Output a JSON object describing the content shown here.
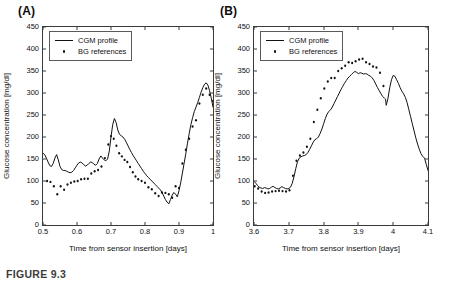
{
  "figure": {
    "caption": "FIGURE 9.3"
  },
  "panels": [
    {
      "label": "(A)",
      "legend": {
        "line_label": "CGM profile",
        "dot_label": "BG references"
      },
      "xlabel": "Time from sensor insertion [days]",
      "ylabel": "Glucose concentration [mg/dl]",
      "xticks": [
        "0.5",
        "0.6",
        "0.7",
        "0.8",
        "0.9",
        "1"
      ],
      "yticks": [
        "0",
        "50",
        "100",
        "150",
        "200",
        "250",
        "300",
        "350",
        "400",
        "450"
      ]
    },
    {
      "label": "(B)",
      "legend": {
        "line_label": "CGM profile",
        "dot_label": "BG references"
      },
      "xlabel": "Time from sensor insertion [days]",
      "ylabel": "Glucose concentration [mg/dl]",
      "xticks": [
        "3.6",
        "3.7",
        "3.8",
        "3.9",
        "4",
        "4.1"
      ],
      "yticks": [
        "0",
        "50",
        "100",
        "150",
        "200",
        "250",
        "300",
        "350",
        "400",
        "450"
      ]
    }
  ],
  "chart_data": [
    {
      "type": "line",
      "panel": "(A)",
      "title": "",
      "xlabel": "Time from sensor insertion [days]",
      "ylabel": "Glucose concentration [mg/dl]",
      "xlim": [
        0.5,
        1.0
      ],
      "ylim": [
        0,
        450
      ],
      "xticks": [
        0.5,
        0.6,
        0.7,
        0.8,
        0.9,
        1.0
      ],
      "yticks": [
        0,
        50,
        100,
        150,
        200,
        250,
        300,
        350,
        400,
        450
      ],
      "grid": false,
      "legend_position": "upper-left",
      "series": [
        {
          "name": "CGM profile",
          "style": "line",
          "color": "#111111",
          "x": [
            0.5,
            0.505,
            0.51,
            0.515,
            0.52,
            0.525,
            0.53,
            0.535,
            0.54,
            0.545,
            0.55,
            0.555,
            0.56,
            0.565,
            0.57,
            0.575,
            0.58,
            0.585,
            0.59,
            0.595,
            0.6,
            0.605,
            0.61,
            0.615,
            0.62,
            0.625,
            0.63,
            0.635,
            0.64,
            0.645,
            0.65,
            0.655,
            0.66,
            0.665,
            0.67,
            0.675,
            0.68,
            0.685,
            0.69,
            0.695,
            0.7,
            0.705,
            0.71,
            0.715,
            0.72,
            0.725,
            0.73,
            0.735,
            0.74,
            0.745,
            0.75,
            0.755,
            0.76,
            0.765,
            0.77,
            0.775,
            0.78,
            0.785,
            0.79,
            0.795,
            0.8,
            0.805,
            0.81,
            0.815,
            0.82,
            0.825,
            0.83,
            0.835,
            0.84,
            0.845,
            0.85,
            0.855,
            0.86,
            0.865,
            0.87,
            0.875,
            0.88,
            0.885,
            0.89,
            0.895,
            0.9,
            0.905,
            0.91,
            0.915,
            0.92,
            0.925,
            0.93,
            0.935,
            0.94,
            0.945,
            0.95,
            0.955,
            0.96,
            0.965,
            0.97,
            0.975,
            0.98,
            0.985,
            0.99,
            0.995,
            1.0
          ],
          "y": [
            163,
            160,
            152,
            143,
            135,
            133,
            140,
            152,
            160,
            148,
            133,
            126,
            124,
            124,
            122,
            120,
            119,
            120,
            124,
            130,
            136,
            141,
            143,
            141,
            137,
            134,
            136,
            140,
            143,
            142,
            138,
            136,
            140,
            150,
            157,
            152,
            148,
            146,
            150,
            168,
            200,
            228,
            242,
            233,
            216,
            206,
            203,
            200,
            195,
            188,
            180,
            172,
            165,
            158,
            152,
            146,
            140,
            134,
            128,
            122,
            117,
            112,
            108,
            104,
            100,
            96,
            92,
            88,
            84,
            80,
            74,
            66,
            58,
            52,
            48,
            58,
            68,
            74,
            70,
            64,
            78,
            96,
            118,
            140,
            162,
            186,
            208,
            228,
            244,
            258,
            268,
            278,
            290,
            302,
            312,
            320,
            323,
            318,
            305,
            288,
            268
          ]
        },
        {
          "name": "BG references",
          "style": "scatter",
          "color": "#111111",
          "x": [
            0.512,
            0.522,
            0.532,
            0.542,
            0.552,
            0.562,
            0.572,
            0.582,
            0.592,
            0.602,
            0.612,
            0.622,
            0.632,
            0.642,
            0.652,
            0.662,
            0.672,
            0.682,
            0.692,
            0.7,
            0.708,
            0.716,
            0.724,
            0.732,
            0.74,
            0.748,
            0.756,
            0.764,
            0.772,
            0.78,
            0.79,
            0.8,
            0.81,
            0.82,
            0.83,
            0.84,
            0.85,
            0.86,
            0.87,
            0.88,
            0.89,
            0.9,
            0.91,
            0.92,
            0.93,
            0.94,
            0.95,
            0.96,
            0.97,
            0.98,
            0.99,
            1.0
          ],
          "y": [
            100,
            98,
            88,
            70,
            88,
            80,
            92,
            96,
            99,
            100,
            104,
            105,
            105,
            117,
            122,
            125,
            133,
            152,
            183,
            202,
            196,
            180,
            163,
            156,
            148,
            143,
            132,
            120,
            110,
            104,
            100,
            96,
            86,
            81,
            72,
            66,
            74,
            73,
            70,
            62,
            88,
            84,
            140,
            171,
            196,
            224,
            238,
            276,
            296,
            310,
            296,
            282
          ]
        }
      ]
    },
    {
      "type": "line",
      "panel": "(B)",
      "title": "",
      "xlabel": "Time from sensor insertion [days]",
      "ylabel": "Glucose concentration [mg/dl]",
      "xlim": [
        3.6,
        4.1
      ],
      "ylim": [
        0,
        450
      ],
      "xticks": [
        3.6,
        3.7,
        3.8,
        3.9,
        4.0,
        4.1
      ],
      "yticks": [
        0,
        50,
        100,
        150,
        200,
        250,
        300,
        350,
        400,
        450
      ],
      "grid": false,
      "legend_position": "upper-left",
      "series": [
        {
          "name": "CGM profile",
          "style": "line",
          "color": "#111111",
          "x": [
            3.6,
            3.605,
            3.61,
            3.615,
            3.62,
            3.625,
            3.63,
            3.635,
            3.64,
            3.645,
            3.65,
            3.655,
            3.66,
            3.665,
            3.67,
            3.675,
            3.68,
            3.685,
            3.69,
            3.695,
            3.7,
            3.705,
            3.71,
            3.715,
            3.72,
            3.725,
            3.73,
            3.735,
            3.74,
            3.745,
            3.75,
            3.755,
            3.76,
            3.765,
            3.77,
            3.775,
            3.78,
            3.785,
            3.79,
            3.795,
            3.8,
            3.805,
            3.81,
            3.815,
            3.82,
            3.825,
            3.83,
            3.835,
            3.84,
            3.845,
            3.85,
            3.855,
            3.86,
            3.865,
            3.87,
            3.875,
            3.88,
            3.885,
            3.89,
            3.895,
            3.9,
            3.905,
            3.91,
            3.915,
            3.92,
            3.925,
            3.93,
            3.935,
            3.94,
            3.945,
            3.95,
            3.955,
            3.96,
            3.965,
            3.97,
            3.975,
            3.978,
            3.98,
            3.985,
            3.99,
            3.995,
            4.0,
            4.005,
            4.01,
            4.015,
            4.02,
            4.025,
            4.03,
            4.035,
            4.04,
            4.045,
            4.05,
            4.055,
            4.06,
            4.065,
            4.07,
            4.075,
            4.08,
            4.085,
            4.09,
            4.095,
            4.1
          ],
          "y": [
            99,
            95,
            90,
            86,
            84,
            83,
            85,
            84,
            82,
            83,
            86,
            88,
            85,
            83,
            82,
            84,
            87,
            85,
            83,
            82,
            83,
            86,
            95,
            110,
            128,
            144,
            152,
            155,
            157,
            158,
            160,
            165,
            172,
            180,
            188,
            194,
            196,
            200,
            208,
            218,
            230,
            242,
            252,
            258,
            262,
            268,
            276,
            284,
            292,
            300,
            308,
            315,
            322,
            328,
            334,
            338,
            342,
            346,
            349,
            347,
            344,
            346,
            345,
            343,
            344,
            343,
            340,
            338,
            334,
            328,
            320,
            312,
            305,
            298,
            292,
            288,
            286,
            272,
            288,
            312,
            330,
            340,
            338,
            330,
            322,
            312,
            304,
            298,
            290,
            278,
            262,
            246,
            230,
            214,
            198,
            184,
            172,
            162,
            156,
            152,
            138,
            124
          ]
        },
        {
          "name": "BG references",
          "style": "scatter",
          "color": "#111111",
          "x": [
            3.602,
            3.612,
            3.622,
            3.632,
            3.642,
            3.652,
            3.662,
            3.672,
            3.682,
            3.692,
            3.702,
            3.712,
            3.722,
            3.732,
            3.742,
            3.752,
            3.762,
            3.772,
            3.782,
            3.792,
            3.802,
            3.812,
            3.822,
            3.832,
            3.842,
            3.852,
            3.862,
            3.872,
            3.882,
            3.892,
            3.902,
            3.912,
            3.922,
            3.932,
            3.942,
            3.952,
            3.962,
            3.972
          ],
          "y": [
            88,
            83,
            76,
            73,
            74,
            76,
            77,
            78,
            77,
            76,
            79,
            112,
            146,
            158,
            165,
            178,
            196,
            234,
            262,
            288,
            310,
            326,
            334,
            334,
            350,
            356,
            362,
            370,
            368,
            372,
            376,
            378,
            370,
            366,
            360,
            358,
            346,
            316
          ]
        }
      ]
    }
  ]
}
